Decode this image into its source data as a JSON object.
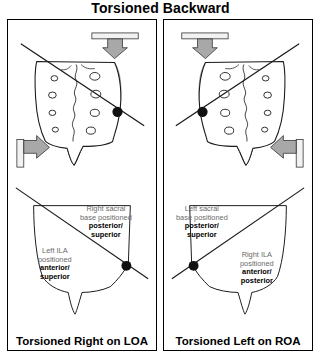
{
  "figure": {
    "title": "Torsioned Backward"
  },
  "panels": [
    {
      "id": "left",
      "caption": "Torsioned Right on LOA",
      "annotations": {
        "sacral_base": {
          "line1": "Right sacral",
          "line2": "base positioned",
          "line3": "posterior/",
          "line4": "superior"
        },
        "ila": {
          "line1": "Left ILA",
          "line2": "positioned",
          "line3": "anterior/",
          "line4": "superior"
        }
      },
      "icons": {
        "axis_pivot": "pivot-dot-icon",
        "force_top": "downward-force-arrow-icon",
        "force_side": "rightward-force-arrow-icon",
        "sacrum": "sacrum-illustration-icon",
        "oblique_axis": "oblique-axis-line-icon"
      }
    },
    {
      "id": "right",
      "caption": "Torsioned Left on ROA",
      "annotations": {
        "sacral_base": {
          "line1": "Left sacral",
          "line2": "base positioned",
          "line3": "posterior/",
          "line4": "superior"
        },
        "ila": {
          "line1": "Right ILA",
          "line2": "positioned",
          "line3": "anterior/",
          "line4": "posterior"
        }
      },
      "icons": {
        "axis_pivot": "pivot-dot-icon",
        "force_top": "downward-force-arrow-icon",
        "force_side": "leftward-force-arrow-icon",
        "sacrum": "sacrum-illustration-icon",
        "oblique_axis": "oblique-axis-line-icon"
      }
    }
  ],
  "colors": {
    "stroke": "#000000",
    "background": "#ffffff",
    "shading": "#b0b0b0",
    "annotation_text": "#6a6a6a",
    "emphasis_text": "#000000"
  }
}
